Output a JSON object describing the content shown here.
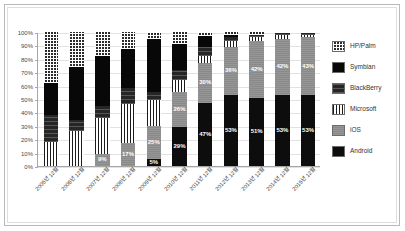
{
  "chart_data": {
    "type": "bar",
    "subtype": "stacked-percent",
    "title": "",
    "xlabel": "",
    "ylabel": "",
    "ylim": [
      0,
      100
    ],
    "ytick_labels": [
      "0%",
      "10%",
      "20%",
      "30%",
      "40%",
      "50%",
      "60%",
      "70%",
      "80%",
      "90%",
      "100%"
    ],
    "ytick_values": [
      0,
      10,
      20,
      30,
      40,
      50,
      60,
      70,
      80,
      90,
      100
    ],
    "grid": true,
    "legend_position": "right",
    "categories": [
      "2005년 12월",
      "2006년 12월",
      "2007년 12월",
      "2008년 12월",
      "2009년 12월",
      "2010년 12월",
      "2011년 12월",
      "2012년 12월",
      "2013년 12월",
      "2014년 12월",
      "2015년 12월"
    ],
    "series": [
      {
        "name": "Android",
        "key": "android",
        "pattern": "solid-black",
        "color": "#0d0d0d",
        "values": [
          0,
          0,
          0,
          0,
          5,
          29,
          47,
          53,
          51,
          53,
          53
        ],
        "labels": [
          "",
          "",
          "",
          "",
          "5%",
          "29%",
          "47%",
          "53%",
          "51%",
          "53%",
          "53%"
        ]
      },
      {
        "name": "iOS",
        "key": "ios",
        "pattern": "gray",
        "color": "#8a8a8a",
        "values": [
          0,
          0,
          9,
          17,
          25,
          26,
          30,
          36,
          42,
          42,
          43
        ],
        "labels": [
          "",
          "",
          "9%",
          "17%",
          "25%",
          "26%",
          "30%",
          "36%",
          "42%",
          "42%",
          "43%"
        ]
      },
      {
        "name": "Microsoft",
        "key": "microsoft",
        "pattern": "vertical-stripes",
        "color": "#f2f2f2",
        "values": [
          18,
          26,
          27,
          29,
          19,
          9,
          5,
          4,
          3,
          3,
          2
        ],
        "labels": [
          "",
          "",
          "",
          "",
          "",
          "",
          "",
          "",
          "",
          "",
          ""
        ]
      },
      {
        "name": "BlackBerry",
        "key": "blackberry",
        "pattern": "dark-horizontal-lines",
        "color": "#262626",
        "values": [
          20,
          8,
          9,
          12,
          6,
          8,
          7,
          3,
          2,
          1,
          1
        ],
        "labels": [
          "",
          "",
          "",
          "",
          "",
          "",
          "",
          "",
          "",
          "",
          ""
        ]
      },
      {
        "name": "Symbian",
        "key": "symbian",
        "pattern": "solid-black",
        "color": "#080808",
        "values": [
          24,
          40,
          37,
          29,
          40,
          19,
          8,
          2,
          0,
          0,
          0
        ],
        "labels": [
          "",
          "",
          "",
          "",
          "",
          "",
          "",
          "",
          "",
          "",
          ""
        ]
      },
      {
        "name": "HP/Palm",
        "key": "hppalm",
        "pattern": "crosshatch",
        "color": "#2b2b2b",
        "values": [
          38,
          26,
          18,
          13,
          5,
          9,
          3,
          2,
          2,
          1,
          1
        ],
        "labels": [
          "",
          "",
          "",
          "",
          "",
          "",
          "",
          "",
          "",
          "",
          ""
        ]
      }
    ],
    "legend_order": [
      "HP/Palm",
      "Symbian",
      "BlackBerry",
      "Microsoft",
      "iOS",
      "Android"
    ]
  },
  "legend": {
    "items": [
      {
        "label": "HP/Palm",
        "key": "hppalm"
      },
      {
        "label": "Symbian",
        "key": "symbian"
      },
      {
        "label": "BlackBerry",
        "key": "blackberry"
      },
      {
        "label": "Microsoft",
        "key": "microsoft"
      },
      {
        "label": "iOS",
        "key": "ios"
      },
      {
        "label": "Android",
        "key": "android"
      }
    ]
  }
}
